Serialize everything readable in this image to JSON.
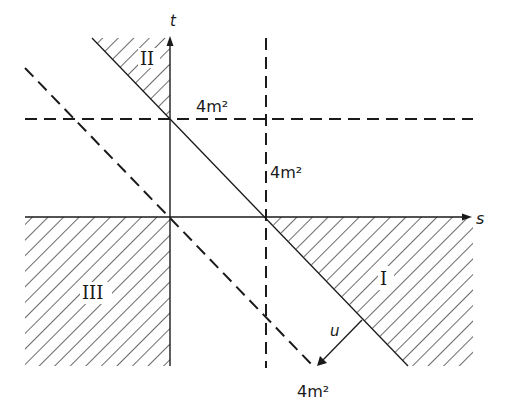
{
  "diagram": {
    "type": "Mandelstam plane",
    "axes": {
      "s_label": "s",
      "t_label": "t",
      "u_label": "u"
    },
    "regions": [
      {
        "id": "I",
        "label": "I"
      },
      {
        "id": "II",
        "label": "II"
      },
      {
        "id": "III",
        "label": "III"
      }
    ],
    "threshold_labels": {
      "t_threshold": "4m²",
      "s_threshold": "4m²",
      "u_threshold": "4m²"
    },
    "colors": {
      "ink": "#1a1a1a",
      "background": "#ffffff"
    }
  }
}
